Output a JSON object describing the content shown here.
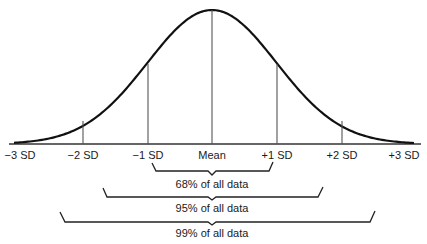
{
  "diagram": {
    "type": "normal-distribution",
    "colors": {
      "curve": "#111111",
      "lines": "#333333",
      "text": "#1a1a1a",
      "background": "#ffffff"
    },
    "axis_labels": [
      {
        "key": "m3",
        "label": "−3 SD"
      },
      {
        "key": "m2",
        "label": "−2 SD"
      },
      {
        "key": "m1",
        "label": "−1 SD"
      },
      {
        "key": "mean",
        "label": "Mean"
      },
      {
        "key": "p1",
        "label": "+1 SD"
      },
      {
        "key": "p2",
        "label": "+2 SD"
      },
      {
        "key": "p3",
        "label": "+3 SD"
      }
    ],
    "brackets": [
      {
        "range": "±1 SD",
        "label": "68% of all data"
      },
      {
        "range": "±2 SD",
        "label": "95% of all data"
      },
      {
        "range": "±3 SD",
        "label": "99% of all data"
      }
    ]
  }
}
